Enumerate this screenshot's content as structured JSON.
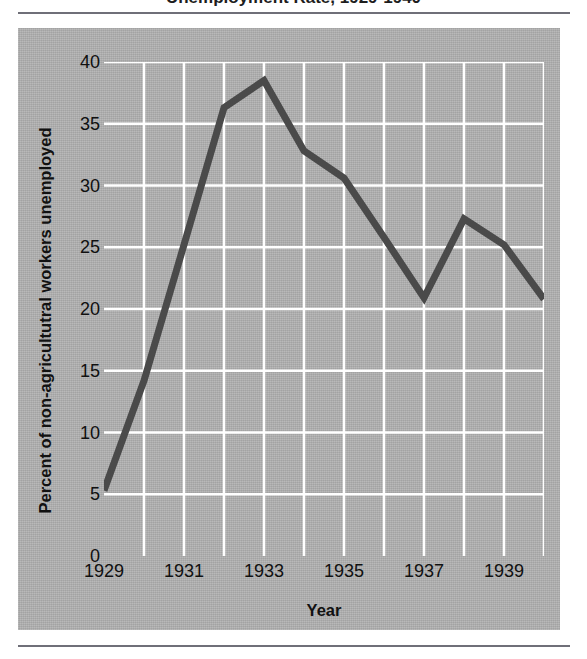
{
  "figure": {
    "title_cropped": "Unemployment Rate, 1929-1940",
    "panel_color": "#b2b2b2",
    "grid_color": "#ffffff",
    "line_color": "#4a4a4a",
    "rule_color": "#6f6f78"
  },
  "chart_data": {
    "type": "line",
    "title": "Unemployment Rate, 1929-1940",
    "xlabel": "Year",
    "ylabel": "Percent of non-agricultutral workers unemployed",
    "x": [
      1929,
      1930,
      1931,
      1932,
      1933,
      1934,
      1935,
      1936,
      1937,
      1938,
      1939,
      1940
    ],
    "values": [
      5.3,
      14.2,
      25.2,
      36.3,
      38.5,
      32.8,
      30.6,
      25.8,
      20.9,
      27.3,
      25.2,
      20.8
    ],
    "series": [
      {
        "name": "Percent of non-agricultutral workers unemployed",
        "values": [
          5.3,
          14.2,
          25.2,
          36.3,
          38.5,
          32.8,
          30.6,
          25.8,
          20.9,
          27.3,
          25.2,
          20.8
        ]
      }
    ],
    "xlim": [
      1929,
      1940
    ],
    "ylim": [
      0,
      40
    ],
    "ytick_labels": [
      "0",
      "5",
      "10",
      "15",
      "20",
      "25",
      "30",
      "35",
      "40"
    ],
    "ytick_values": [
      0,
      5,
      10,
      15,
      20,
      25,
      30,
      35,
      40
    ],
    "xtick_labels": [
      "1929",
      "1931",
      "1933",
      "1935",
      "1937",
      "1939"
    ],
    "xtick_values": [
      1929,
      1931,
      1933,
      1935,
      1937,
      1939
    ],
    "xminor_values": [
      1930,
      1932,
      1934,
      1936,
      1938,
      1940
    ],
    "grid": true,
    "legend": "none"
  }
}
